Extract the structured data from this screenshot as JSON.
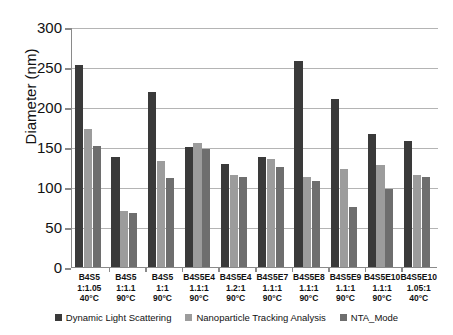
{
  "chart_data": {
    "type": "bar",
    "title": "",
    "xlabel": "",
    "ylabel": "Diameter (nm)",
    "ylim": [
      0,
      300
    ],
    "ytick_values": [
      0,
      50,
      100,
      150,
      200,
      250,
      300
    ],
    "ytick_labels": [
      "0",
      "50",
      "100",
      "150",
      "200",
      "250",
      "300"
    ],
    "grid": "horizontal",
    "legend_position": "bottom-center",
    "categories": [
      "B4S5 1:1.05 40°C",
      "B4S5 1:1.1 90°C",
      "B4S5 1:1 90°C",
      "B4S5E4 1.1:1 90°C",
      "B4S5E4 1.2:1 90°C",
      "B4S5E7 1.1:1 90°C",
      "B4S5E8 1.1:1 90°C",
      "B4S5E9 1.1:1 90°C",
      "B4S5E10 1.1:1 90°C",
      "B4S5E10 1.05:1 40°C"
    ],
    "category_lines": [
      [
        "B4S5",
        "1:1.05",
        "40°C"
      ],
      [
        "B4S5",
        "1:1.1",
        "90°C"
      ],
      [
        "B4S5",
        "1:1",
        "90°C"
      ],
      [
        "B4S5E4",
        "1.1:1",
        "90°C"
      ],
      [
        "B4S5E4",
        "1.2:1",
        "90°C"
      ],
      [
        "B4S5E7",
        "1.1:1",
        "90°C"
      ],
      [
        "B4S5E8",
        "1.1:1",
        "90°C"
      ],
      [
        "B4S5E9",
        "1.1:1",
        "90°C"
      ],
      [
        "B4S5E10",
        "1.1:1",
        "90°C"
      ],
      [
        "B4S5E10",
        "1.05:1",
        "40°C"
      ]
    ],
    "series": [
      {
        "name": "Dynamic Light Scattering",
        "color": "#3a3a3a",
        "values": [
          253,
          138,
          219,
          150,
          129,
          137,
          258,
          210,
          166,
          158
        ]
      },
      {
        "name": "Nanoparticle Tracking Analysis",
        "color": "#9c9c9c",
        "values": [
          172,
          70,
          133,
          155,
          115,
          135,
          113,
          122,
          128,
          115
        ]
      },
      {
        "name": "NTA_Mode",
        "color": "#6e6e6e",
        "values": [
          151,
          68,
          111,
          148,
          112,
          125,
          108,
          75,
          98,
          112
        ]
      }
    ]
  },
  "legend": {
    "items": [
      {
        "label": "Dynamic Light Scattering",
        "color": "#3a3a3a"
      },
      {
        "label": "Nanoparticle Tracking Analysis",
        "color": "#9c9c9c"
      },
      {
        "label": "NTA_Mode",
        "color": "#6e6e6e"
      }
    ]
  }
}
